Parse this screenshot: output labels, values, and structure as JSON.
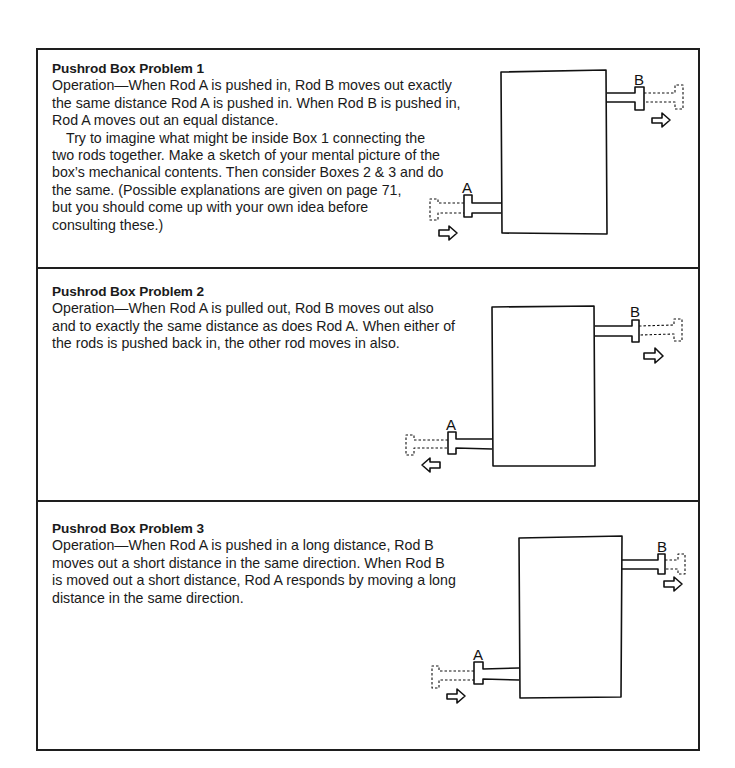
{
  "problems": [
    {
      "title": "Pushrod Box Problem 1",
      "lines": [
        "Operation—When Rod A is pushed in, Rod B moves out exactly",
        "the same distance Rod A is pushed in. When Rod B is pushed in,",
        "Rod A moves out an equal distance."
      ],
      "lines2": [
        "Try to imagine what might be inside Box 1 connecting the",
        "two rods together. Make a sketch of your mental picture of the",
        "box’s mechanical contents. Then consider Boxes 2 & 3 and do",
        "the same. (Possible explanations are given on page 71,",
        "but you should come up with your own idea before",
        "consulting these.)"
      ],
      "rod_a_label": "A",
      "rod_b_label": "B",
      "rod_a_arrow": "right",
      "rod_b_arrow": "right"
    },
    {
      "title": "Pushrod Box Problem 2",
      "lines": [
        "Operation—When Rod A is pulled out, Rod B moves out also",
        "and to exactly the same distance as does Rod A. When either of",
        "the rods is pushed back in, the other rod moves in also."
      ],
      "rod_a_label": "A",
      "rod_b_label": "B",
      "rod_a_arrow": "left",
      "rod_b_arrow": "right"
    },
    {
      "title": "Pushrod Box Problem 3",
      "lines": [
        "Operation—When Rod A is pushed in a long distance, Rod B",
        "moves out a short distance in the same direction. When Rod B",
        "is moved out a short distance, Rod A responds by moving a long",
        "distance in the same direction."
      ],
      "rod_a_label": "A",
      "rod_b_label": "B",
      "rod_a_arrow": "right",
      "rod_b_arrow": "right"
    }
  ]
}
